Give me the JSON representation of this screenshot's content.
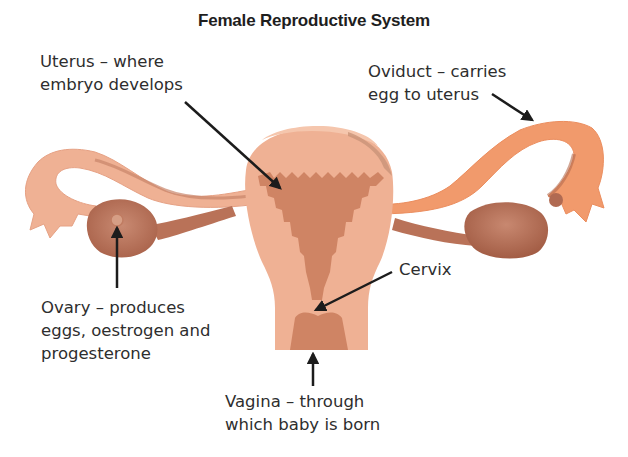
{
  "title": "Female Reproductive System",
  "labels": {
    "uterus": {
      "line1": "Uterus – where",
      "line2": "embryo develops"
    },
    "oviduct": {
      "line1": "Oviduct – carries",
      "line2": "egg to uterus"
    },
    "cervix": {
      "line1": "Cervix"
    },
    "ovary": {
      "line1": "Ovary – produces",
      "line2": "eggs, oestrogen and",
      "line3": "progesterone"
    },
    "vagina": {
      "line1": "Vagina – through",
      "line2": "which baby is born"
    }
  },
  "colors": {
    "tissue_light": "#efb194",
    "tissue_mid": "#e6a184",
    "endometrium": "#cf8464",
    "ovary": "#b87058",
    "oviduct_right": "#f19a6c",
    "arrow": "#1c1c1c"
  }
}
